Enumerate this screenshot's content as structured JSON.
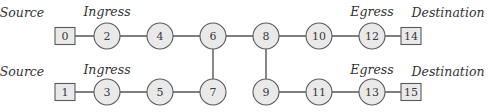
{
  "diagram": {
    "type": "network-topology",
    "colors": {
      "node_fill": "#e9e9e9",
      "node_stroke": "#5a5a5a",
      "edge": "#555555",
      "label": "#333333"
    },
    "labels": [
      {
        "id": "source-top",
        "text": "Source",
        "x": 22,
        "y": 17
      },
      {
        "id": "ingress-top",
        "text": "Ingress",
        "x": 107,
        "y": 16
      },
      {
        "id": "egress-top",
        "text": "Egress",
        "x": 372,
        "y": 16
      },
      {
        "id": "destination-top",
        "text": "Destination",
        "x": 448,
        "y": 17
      },
      {
        "id": "source-bottom",
        "text": "Source",
        "x": 22,
        "y": 76
      },
      {
        "id": "ingress-bottom",
        "text": "Ingress",
        "x": 107,
        "y": 74
      },
      {
        "id": "egress-bottom",
        "text": "Egress",
        "x": 372,
        "y": 74
      },
      {
        "id": "destination-bottom",
        "text": "Destination",
        "x": 448,
        "y": 76
      }
    ],
    "nodes": [
      {
        "id": "0",
        "label": "0",
        "shape": "box",
        "x": 65,
        "y": 36
      },
      {
        "id": "2",
        "label": "2",
        "shape": "circle",
        "x": 107,
        "y": 36
      },
      {
        "id": "4",
        "label": "4",
        "shape": "circle",
        "x": 160,
        "y": 36
      },
      {
        "id": "6",
        "label": "6",
        "shape": "circle",
        "x": 213,
        "y": 36
      },
      {
        "id": "8",
        "label": "8",
        "shape": "circle",
        "x": 266,
        "y": 36
      },
      {
        "id": "10",
        "label": "10",
        "shape": "circle",
        "x": 319,
        "y": 36
      },
      {
        "id": "12",
        "label": "12",
        "shape": "circle",
        "x": 372,
        "y": 36
      },
      {
        "id": "14",
        "label": "14",
        "shape": "box",
        "x": 411,
        "y": 36
      },
      {
        "id": "1",
        "label": "1",
        "shape": "box",
        "x": 65,
        "y": 92
      },
      {
        "id": "3",
        "label": "3",
        "shape": "circle",
        "x": 107,
        "y": 92
      },
      {
        "id": "5",
        "label": "5",
        "shape": "circle",
        "x": 160,
        "y": 92
      },
      {
        "id": "7",
        "label": "7",
        "shape": "circle",
        "x": 213,
        "y": 92
      },
      {
        "id": "9",
        "label": "9",
        "shape": "circle",
        "x": 266,
        "y": 92
      },
      {
        "id": "11",
        "label": "11",
        "shape": "circle",
        "x": 319,
        "y": 92
      },
      {
        "id": "13",
        "label": "13",
        "shape": "circle",
        "x": 372,
        "y": 92
      },
      {
        "id": "15",
        "label": "15",
        "shape": "box",
        "x": 411,
        "y": 92
      }
    ],
    "edges": [
      [
        "0",
        "2"
      ],
      [
        "2",
        "4"
      ],
      [
        "4",
        "6"
      ],
      [
        "6",
        "8"
      ],
      [
        "8",
        "10"
      ],
      [
        "10",
        "12"
      ],
      [
        "12",
        "14"
      ],
      [
        "1",
        "3"
      ],
      [
        "3",
        "5"
      ],
      [
        "5",
        "7"
      ],
      [
        "7",
        "6"
      ],
      [
        "8",
        "9"
      ],
      [
        "9",
        "11"
      ],
      [
        "11",
        "13"
      ],
      [
        "13",
        "15"
      ]
    ]
  }
}
